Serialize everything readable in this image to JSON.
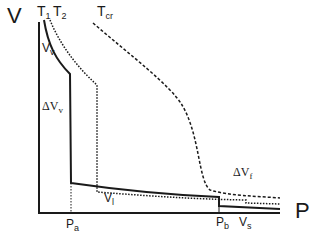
{
  "diagram": {
    "type": "phase diagram (volume vs pressure isotherms)",
    "axes": {
      "y_label": "V",
      "x_label": "P"
    },
    "isotherm_labels": [
      {
        "main": "T",
        "sub": "1"
      },
      {
        "main": "T",
        "sub": "2"
      },
      {
        "main": "T",
        "sub": "cr"
      }
    ],
    "region_labels": {
      "vapor_volume": {
        "main": "V",
        "sub": "v"
      },
      "delta_vapor": {
        "prefix": "Δ",
        "main": "V",
        "sub": "v"
      },
      "liquid_volume": {
        "main": "V",
        "sub": "l"
      },
      "delta_fluid": {
        "prefix": "Δ",
        "main": "V",
        "sub": "f"
      },
      "solid_volume": {
        "main": "V",
        "sub": "s"
      }
    },
    "pressure_marks": [
      {
        "main": "P",
        "sub": "a"
      },
      {
        "main": "P",
        "sub": "b"
      }
    ],
    "colors": {
      "line": "#1a1a1a",
      "background": "#ffffff"
    }
  }
}
